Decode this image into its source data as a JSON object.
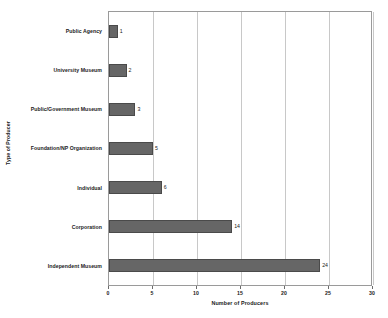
{
  "chart_data": {
    "type": "bar",
    "orientation": "horizontal",
    "title": "",
    "xlabel": "Number of Producers",
    "ylabel": "Type of Producer",
    "categories": [
      "Public Agency",
      "University Museum",
      "Public/Government Museum",
      "Foundation/NP Organization",
      "Individual",
      "Corporation",
      "Independent Museum"
    ],
    "values": [
      1,
      2,
      3,
      5,
      6,
      14,
      24
    ],
    "data_labels": [
      "1",
      "2",
      "3",
      "5",
      "6",
      "14",
      "24"
    ],
    "xlim": [
      0,
      30
    ],
    "xticks": [
      0,
      5,
      10,
      15,
      20,
      25,
      30
    ],
    "xtick_labels": [
      "0",
      "5",
      "10",
      "15",
      "20",
      "25",
      "30"
    ],
    "grid": "vertical",
    "legend": "none",
    "bar_color": "#666666",
    "bar_border_color": "#4a4a4a",
    "gridline_color": "#c8c8c8",
    "axis_color": "#9a9a9a",
    "background_color": "#ffffff",
    "text_color": "#1a1a1a"
  }
}
